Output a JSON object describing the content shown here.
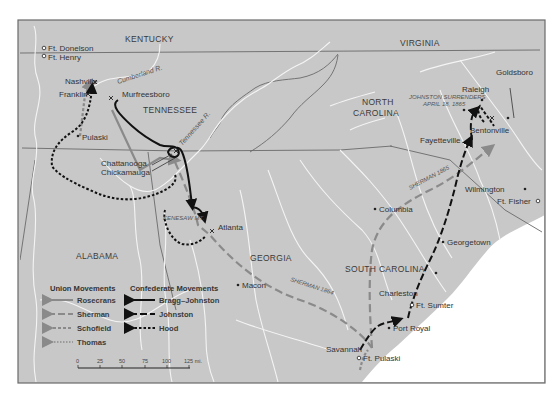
{
  "map": {
    "states": {
      "kentucky": "KENTUCKY",
      "virginia": "VIRGINIA",
      "tennessee": "TENNESSEE",
      "north_carolina_1": "NORTH",
      "north_carolina_2": "CAROLINA",
      "alabama": "ALABAMA",
      "georgia": "GEORGIA",
      "south_carolina": "SOUTH CAROLINA"
    },
    "rivers": {
      "cumberland": "Cumberland R.",
      "tennessee": "Tennessee R."
    },
    "cities": {
      "ft_donelson": "Ft. Donelson",
      "ft_henry": "Ft. Henry",
      "nashville": "Nashville",
      "franklin": "Franklin",
      "murfreesboro": "Murfreesboro",
      "pulaski": "Pulaski",
      "chattanooga": "Chattanooga",
      "chickamauga": "Chickamauga",
      "atlanta": "Atlanta",
      "macon": "Macon",
      "columbia": "Columbia",
      "savannah": "Savannah",
      "ft_pulaski": "Ft. Pulaski",
      "port_royal": "Port Royal",
      "charleston": "Charleston",
      "ft_sumter": "Ft. Sumter",
      "georgetown": "Georgetown",
      "wilmington": "Wilmington",
      "ft_fisher": "Ft. Fisher",
      "fayetteville": "Fayetteville",
      "bentonville": "Bentonville",
      "raleigh": "Raleigh",
      "goldsboro": "Goldsboro"
    },
    "annotations": {
      "kenesaw": "KENESAW MT.",
      "sherman_1864": "SHERMAN 1864",
      "sherman_1865": "SHERMAN 1865",
      "surrender_1": "JOHNSTON SURRENDERS",
      "surrender_2": "APRIL 18, 1865"
    }
  },
  "legend": {
    "union_title": "Union Movements",
    "confederate_title": "Confederate Movements",
    "union": [
      {
        "label": "Rosecrans",
        "style": "solid-gray"
      },
      {
        "label": "Sherman",
        "style": "long-dash-gray"
      },
      {
        "label": "Schofield",
        "style": "short-dash-gray"
      },
      {
        "label": "Thomas",
        "style": "dotted-gray"
      }
    ],
    "confederate": [
      {
        "label": "Bragg–Johnston",
        "style": "solid-black"
      },
      {
        "label": "Johnston",
        "style": "long-dash-black"
      },
      {
        "label": "Hood",
        "style": "dotted-black"
      }
    ]
  },
  "scale": {
    "ticks": [
      "0",
      "25",
      "50",
      "75",
      "100",
      "125 mi."
    ]
  },
  "colors": {
    "land": "#c8c8c8",
    "water": "#ffffff",
    "river": "#f4f4f4",
    "border": "#6e6e6e",
    "union": "#8a8a8a",
    "confederate": "#111111"
  }
}
